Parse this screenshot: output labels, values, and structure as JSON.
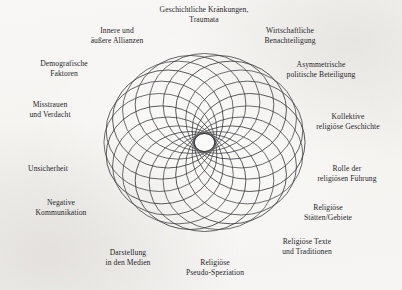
{
  "figure": {
    "type": "radial-label-diagram",
    "center_graphic": "rosette-of-overlapping-circles",
    "background_color": "#f7f6f4",
    "line_color": "#3b3b40",
    "text_color": "#26262a",
    "circle_count": 20,
    "labels": [
      {
        "id": "geschichtliche-kraenkungen",
        "lines": [
          "Geschichtliche Kränkungen,",
          "Traumata"
        ],
        "x": 204,
        "y": 15
      },
      {
        "id": "innere-aeussere-allianzen",
        "lines": [
          "Innere und",
          "äußere Allianzen"
        ],
        "x": 117,
        "y": 36
      },
      {
        "id": "wirtschaftliche-benachteiligung",
        "lines": [
          "Wirtschaftliche",
          "Benachteiligung"
        ],
        "x": 290,
        "y": 36
      },
      {
        "id": "demografische-faktoren",
        "lines": [
          "Demografische",
          "Faktoren"
        ],
        "x": 64,
        "y": 69
      },
      {
        "id": "asymmetrische-politische-beteiligung",
        "lines": [
          "Asymmetrische",
          "politische Beteiligung"
        ],
        "x": 321,
        "y": 70
      },
      {
        "id": "misstrauen-und-verdacht",
        "lines": [
          "Misstrauen",
          "und Verdacht"
        ],
        "x": 50,
        "y": 110
      },
      {
        "id": "kollektive-religioese-geschichte",
        "lines": [
          "Kollektive",
          "religiöse Geschichte"
        ],
        "x": 348,
        "y": 122
      },
      {
        "id": "unsicherheit",
        "lines": [
          "Unsicherheit"
        ],
        "x": 48,
        "y": 169
      },
      {
        "id": "rolle-der-religioesen-fuehrung",
        "lines": [
          "Rolle der",
          "religiösen Führung"
        ],
        "x": 347,
        "y": 174
      },
      {
        "id": "negative-kommunikation",
        "lines": [
          "Negative",
          "Kommunikation"
        ],
        "x": 61,
        "y": 208
      },
      {
        "id": "religioese-staetten-gebiete",
        "lines": [
          "Religiöse",
          "Stätten/Gebiete"
        ],
        "x": 328,
        "y": 213
      },
      {
        "id": "religioese-texte-und-traditionen",
        "lines": [
          "Religiöse Texte",
          "und Traditionen"
        ],
        "x": 307,
        "y": 247
      },
      {
        "id": "darstellung-in-den-medien",
        "lines": [
          "Darstellung",
          "in den Medien"
        ],
        "x": 128,
        "y": 258
      },
      {
        "id": "religioese-pseudo-speziation",
        "lines": [
          "Religiöse",
          "Pseudo-Speziation"
        ],
        "x": 215,
        "y": 268
      }
    ]
  }
}
